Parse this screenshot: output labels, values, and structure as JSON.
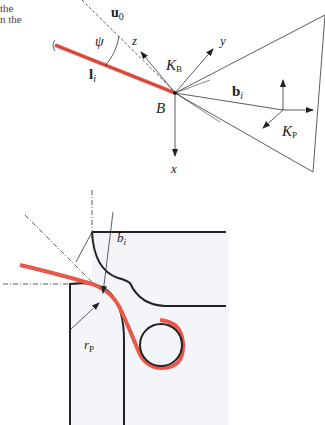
{
  "text_fragment": {
    "line1": "the",
    "line2": "n the"
  },
  "top_diagram": {
    "labels": {
      "u0": "u",
      "u0_sub": "0",
      "psi": "ψ",
      "z": "z",
      "y": "y",
      "x": "x",
      "KB": "K",
      "KB_sub": "B",
      "li": "l",
      "li_sub": "i",
      "bi": "b",
      "bi_sub": "i",
      "B": "B",
      "KP": "K",
      "KP_sub": "P"
    }
  },
  "bottom_diagram": {
    "labels": {
      "bi": "b",
      "bi_sub": "i",
      "rP": "r",
      "rP_sub": "P"
    }
  },
  "colors": {
    "red": "#e8584a",
    "line": "#222222",
    "panel": "#f4f5f8"
  }
}
